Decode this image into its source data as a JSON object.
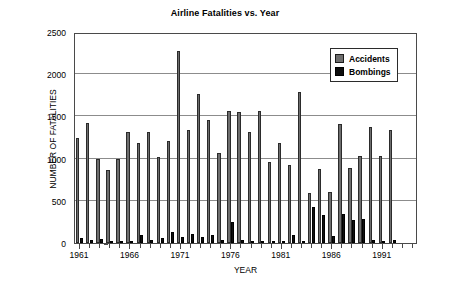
{
  "chart_data": {
    "type": "bar",
    "title": "Airline Fatalities vs. Year",
    "xlabel": "YEAR",
    "ylabel": "NUMBER OF FATALITIES",
    "ylim": [
      0,
      2500
    ],
    "ytick_labels": [
      "0",
      "500",
      "1000",
      "1500",
      "2000",
      "2500"
    ],
    "ytick_values": [
      0,
      500,
      1000,
      1500,
      2000,
      2500
    ],
    "xlim": [
      1961,
      1994
    ],
    "xtick_labels": [
      "1961",
      "1966",
      "1971",
      "1976",
      "1981",
      "1986",
      "1991"
    ],
    "xtick_values": [
      1961,
      1966,
      1971,
      1976,
      1981,
      1986,
      1991
    ],
    "grid": true,
    "legend_position": "top-right",
    "categories": [
      1961,
      1962,
      1963,
      1964,
      1965,
      1966,
      1967,
      1968,
      1969,
      1970,
      1971,
      1972,
      1973,
      1974,
      1975,
      1976,
      1977,
      1978,
      1979,
      1980,
      1981,
      1982,
      1983,
      1984,
      1985,
      1986,
      1987,
      1988,
      1989,
      1990,
      1991,
      1992,
      1993,
      1994
    ],
    "series": [
      {
        "name": "Accidents",
        "color": "#6e6e6e",
        "values": [
          1250,
          1425,
          1000,
          860,
          1000,
          1320,
          1180,
          1320,
          1020,
          1210,
          2275,
          1340,
          1760,
          1460,
          1070,
          1560,
          1550,
          1310,
          1560,
          960,
          1180,
          920,
          1790,
          590,
          880,
          600,
          1410,
          890,
          1030,
          1380,
          1030,
          1340,
          0,
          0
        ]
      },
      {
        "name": "Bombings",
        "color": "#111111",
        "values": [
          60,
          30,
          50,
          20,
          20,
          20,
          100,
          40,
          60,
          130,
          70,
          110,
          70,
          90,
          40,
          250,
          30,
          20,
          10,
          10,
          20,
          100,
          20,
          430,
          330,
          80,
          340,
          270,
          280,
          30,
          20,
          30,
          0,
          0
        ]
      }
    ]
  },
  "legend": {
    "items": [
      {
        "label": "Accidents",
        "swatch": "accidents-swatch"
      },
      {
        "label": "Bombings",
        "swatch": "bombings-swatch"
      }
    ]
  }
}
